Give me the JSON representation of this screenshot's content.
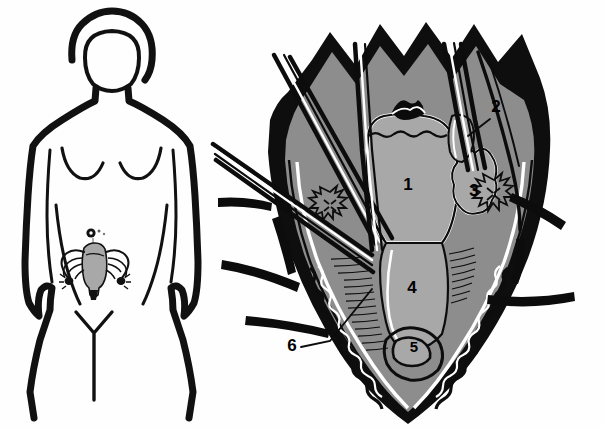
{
  "figure": {
    "background_color": "#fefefe",
    "ink_color": "#000000",
    "tissue_light_gray": "#a8a8a8",
    "tissue_mid_gray": "#8d8d8d",
    "tissue_dark": "#000000",
    "highlight_white": "#ffffff"
  },
  "panels": [
    {
      "id": "body-orientation",
      "name": "female-body-silhouette",
      "caption": "",
      "features": [
        "head-outline",
        "torso-outline",
        "breast-contours",
        "arms",
        "legs",
        "navel-marker",
        "uterus-inset",
        "fallopian-tube-left",
        "fallopian-tube-right",
        "ovary-left",
        "ovary-right",
        "incision-marking"
      ]
    },
    {
      "id": "surgical-field",
      "name": "operative-field-detail",
      "caption": "",
      "features": [
        "retractor-blade-left",
        "retractor-blade-right",
        "clamp-upper-left",
        "clamp-upper-right",
        "clamp-lateral-left",
        "hemostat-pair",
        "peritoneal-edge",
        "abdominal-wall-layers",
        "vascular-pedicle-left",
        "vascular-pedicle-right"
      ]
    }
  ],
  "labels": [
    {
      "id": "label-1",
      "text": "1",
      "x": 408,
      "y": 190,
      "target": "uterine-corpus",
      "leader": false
    },
    {
      "id": "label-2",
      "text": "2",
      "x": 496,
      "y": 112,
      "target": "round-ligament",
      "leader": true,
      "leader_path": "M 490 119 L 468 136"
    },
    {
      "id": "label-3",
      "text": "3",
      "x": 474,
      "y": 196,
      "target": "adnexa-ovary",
      "leader": false
    },
    {
      "id": "label-4",
      "text": "4",
      "x": 412,
      "y": 293,
      "target": "bladder-peritoneum",
      "leader": false
    },
    {
      "id": "label-5",
      "text": "5",
      "x": 414,
      "y": 352,
      "target": "vesicouterine-fold",
      "leader": false
    },
    {
      "id": "label-6",
      "text": "6",
      "x": 292,
      "y": 351,
      "target": "bladder-flap",
      "leader": true,
      "leader_path": "M 301 347 L 330 341 L 372 289"
    }
  ]
}
